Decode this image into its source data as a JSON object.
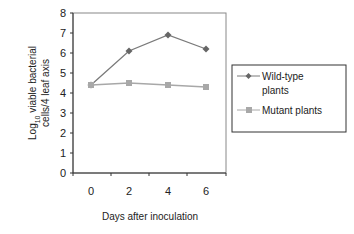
{
  "chart_data": {
    "type": "line",
    "title": "",
    "xlabel": "Days after inoculation",
    "ylabel": "Log10 viable bacterial cells/4 leaf axis",
    "ylabel_line1_prefix": "Log",
    "ylabel_line1_sub": "10",
    "ylabel_line1_suffix": " viable bacterial",
    "ylabel_line2": "cells/4 leaf axis",
    "x": [
      0,
      2,
      4,
      6
    ],
    "x_tick_labels": [
      "0",
      "2",
      "4",
      "6"
    ],
    "y_tick_labels": [
      "0",
      "1",
      "2",
      "3",
      "4",
      "5",
      "6",
      "7",
      "8"
    ],
    "ylim": [
      0,
      8
    ],
    "grid": false,
    "legend_position": "right",
    "series": [
      {
        "name": "Wild-type plants",
        "legend_line1": "Wild-type",
        "legend_line2": "plants",
        "marker": "diamond",
        "color": "#7a7a7a",
        "values": [
          4.4,
          6.1,
          6.9,
          6.2
        ]
      },
      {
        "name": "Mutant plants",
        "legend_line1": "Mutant plants",
        "marker": "square",
        "color": "#a8a8a8",
        "values": [
          4.4,
          4.5,
          4.4,
          4.3
        ]
      }
    ]
  }
}
